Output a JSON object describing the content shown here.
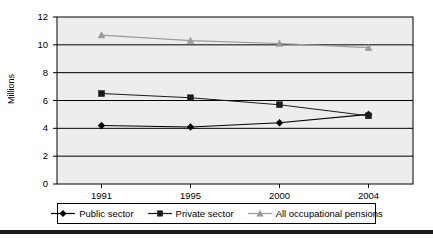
{
  "chart_data": {
    "type": "line",
    "title": "",
    "xlabel": "",
    "ylabel": "Millions",
    "categories": [
      "1991",
      "1995",
      "2000",
      "2004"
    ],
    "ylim": [
      0,
      12
    ],
    "yticks": [
      0,
      2,
      4,
      6,
      8,
      10,
      12
    ],
    "ytick_labels": [
      "0",
      "2",
      "4",
      "6",
      "8",
      "10",
      "12"
    ],
    "grid": "horizontal",
    "legend_position": "bottom",
    "plot_background": "#ededed",
    "series": [
      {
        "name": "Public sector",
        "marker": "diamond",
        "color": "#000000",
        "values": [
          4.2,
          4.1,
          4.4,
          5.0
        ]
      },
      {
        "name": "Private sector",
        "marker": "square",
        "color": "#1c1c1c",
        "values": [
          6.5,
          6.2,
          5.7,
          4.9
        ]
      },
      {
        "name": "All occupational pensions",
        "marker": "triangle",
        "color": "#9a9a9a",
        "values": [
          10.7,
          10.3,
          10.1,
          9.8
        ]
      }
    ]
  },
  "axis": {
    "y_title": "Millions"
  },
  "legend": {
    "items": [
      {
        "label": "Public sector"
      },
      {
        "label": "Private sector"
      },
      {
        "label": "All occupational pensions"
      }
    ]
  }
}
